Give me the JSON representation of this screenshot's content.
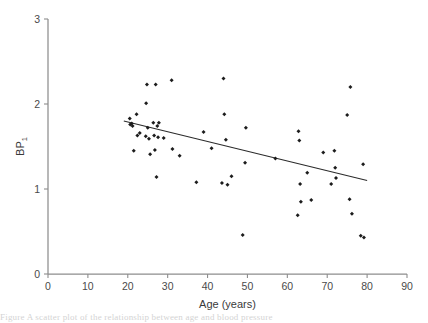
{
  "figure": {
    "background_color": "#ffffff",
    "axis_color": "#8d8d8d",
    "marker_color": "#1c1c1c",
    "line_color": "#2b2b2b",
    "caption_partial": "Figure   A scatter plot of the relationship between age and blood pressure"
  },
  "chart_data": {
    "type": "scatter",
    "title": "",
    "xlabel": "Age (years)",
    "ylabel": "BP",
    "ylabel_subscript": "1",
    "xlim": [
      0,
      90
    ],
    "ylim": [
      0,
      3
    ],
    "xticks": [
      0,
      10,
      20,
      30,
      40,
      50,
      60,
      70,
      80,
      90
    ],
    "yticks": [
      0,
      1,
      2,
      3
    ],
    "xticklabels": [
      "0",
      "10",
      "20",
      "30",
      "40",
      "50",
      "60",
      "70",
      "80",
      "90"
    ],
    "yticklabels": [
      "0",
      "1",
      "2",
      "3"
    ],
    "grid": false,
    "legend": null,
    "points": [
      {
        "x": 20.5,
        "y": 1.83
      },
      {
        "x": 20.6,
        "y": 1.76
      },
      {
        "x": 21.0,
        "y": 1.77
      },
      {
        "x": 21.2,
        "y": 1.74
      },
      {
        "x": 21.5,
        "y": 1.45
      },
      {
        "x": 22.2,
        "y": 1.88
      },
      {
        "x": 22.4,
        "y": 1.63
      },
      {
        "x": 23.0,
        "y": 1.66
      },
      {
        "x": 24.5,
        "y": 1.62
      },
      {
        "x": 24.6,
        "y": 2.01
      },
      {
        "x": 24.8,
        "y": 2.23
      },
      {
        "x": 25.0,
        "y": 1.72
      },
      {
        "x": 25.3,
        "y": 1.59
      },
      {
        "x": 25.6,
        "y": 1.41
      },
      {
        "x": 26.4,
        "y": 1.78
      },
      {
        "x": 26.6,
        "y": 1.63
      },
      {
        "x": 26.8,
        "y": 1.46
      },
      {
        "x": 27.0,
        "y": 2.23
      },
      {
        "x": 27.4,
        "y": 1.74
      },
      {
        "x": 27.6,
        "y": 1.61
      },
      {
        "x": 27.8,
        "y": 1.78
      },
      {
        "x": 27.2,
        "y": 1.14
      },
      {
        "x": 29.0,
        "y": 1.6
      },
      {
        "x": 31.0,
        "y": 2.28
      },
      {
        "x": 31.2,
        "y": 1.47
      },
      {
        "x": 33.0,
        "y": 1.39
      },
      {
        "x": 37.2,
        "y": 1.08
      },
      {
        "x": 39.0,
        "y": 1.67
      },
      {
        "x": 41.0,
        "y": 1.48
      },
      {
        "x": 43.6,
        "y": 1.07
      },
      {
        "x": 44.0,
        "y": 2.3
      },
      {
        "x": 44.2,
        "y": 1.88
      },
      {
        "x": 44.6,
        "y": 1.58
      },
      {
        "x": 45.0,
        "y": 1.05
      },
      {
        "x": 46.0,
        "y": 1.15
      },
      {
        "x": 48.8,
        "y": 0.46
      },
      {
        "x": 49.4,
        "y": 1.31
      },
      {
        "x": 49.6,
        "y": 1.72
      },
      {
        "x": 57.0,
        "y": 1.36
      },
      {
        "x": 62.6,
        "y": 0.69
      },
      {
        "x": 62.8,
        "y": 1.68
      },
      {
        "x": 63.0,
        "y": 1.57
      },
      {
        "x": 63.2,
        "y": 1.06
      },
      {
        "x": 63.4,
        "y": 0.85
      },
      {
        "x": 65.0,
        "y": 1.19
      },
      {
        "x": 66.0,
        "y": 0.87
      },
      {
        "x": 69.0,
        "y": 1.43
      },
      {
        "x": 71.0,
        "y": 1.06
      },
      {
        "x": 71.8,
        "y": 1.45
      },
      {
        "x": 72.0,
        "y": 1.25
      },
      {
        "x": 72.2,
        "y": 1.13
      },
      {
        "x": 75.0,
        "y": 1.87
      },
      {
        "x": 75.6,
        "y": 0.88
      },
      {
        "x": 75.8,
        "y": 2.2
      },
      {
        "x": 76.2,
        "y": 0.71
      },
      {
        "x": 78.4,
        "y": 0.45
      },
      {
        "x": 79.0,
        "y": 1.29
      },
      {
        "x": 79.2,
        "y": 0.43
      }
    ],
    "fit_line": {
      "x0": 19.0,
      "y0": 1.8,
      "x1": 80.0,
      "y1": 1.1
    }
  }
}
